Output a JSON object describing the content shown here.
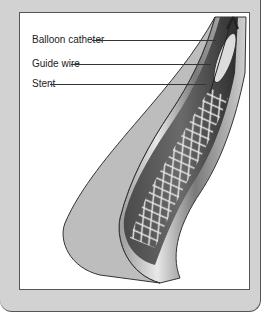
{
  "figure": {
    "labels": [
      {
        "text": "Balloon catheter",
        "target": "balloon-catheter"
      },
      {
        "text": "Guide wire",
        "target": "guide-wire"
      },
      {
        "text": "Stent",
        "target": "stent"
      }
    ]
  },
  "colors": {
    "frame": "#d2d2d2",
    "panel": "#ffffff",
    "outline": "#555555",
    "vessel_dark": "#3a3a3a",
    "vessel_mid": "#8a8a8a",
    "vessel_light": "#cfcfcf"
  }
}
